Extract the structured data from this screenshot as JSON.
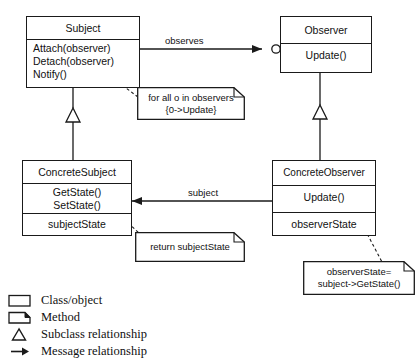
{
  "diagram": {
    "classes": [
      {
        "id": "subject",
        "name": "Subject",
        "operations": [
          "Attach(observer)",
          "Detach(observer)",
          "Notify()"
        ],
        "attributes": []
      },
      {
        "id": "observer",
        "name": "Observer",
        "operations": [
          "Update()"
        ],
        "attributes": []
      },
      {
        "id": "concrete-subject",
        "name": "ConcreteSubject",
        "operations": [
          "GetState()",
          "SetState()"
        ],
        "attributes": [
          "subjectState"
        ]
      },
      {
        "id": "concrete-observer",
        "name": "ConcreteObserver",
        "operations": [
          "Update()"
        ],
        "attributes": [
          "observerState"
        ]
      }
    ],
    "notes": [
      {
        "id": "notify-note",
        "lines": [
          "for all o in observers",
          "{0->Update}"
        ]
      },
      {
        "id": "getstate-note",
        "lines": [
          "return subjectState"
        ]
      },
      {
        "id": "update-note",
        "lines": [
          "observerState=",
          "subject->GetState()"
        ]
      }
    ],
    "edge_labels": {
      "observes": "observes",
      "subject": "subject"
    }
  },
  "legend": {
    "items": [
      {
        "icon": "class-object-icon",
        "label": "Class/object"
      },
      {
        "icon": "method-icon",
        "label": "Method"
      },
      {
        "icon": "subclass-triangle-icon",
        "label": "Subclass relationship"
      },
      {
        "icon": "message-arrow-icon",
        "label": "Message relationship"
      }
    ]
  },
  "colors": {
    "stroke": "#1a1a1a",
    "background": "#ffffff",
    "text": "#111111"
  }
}
